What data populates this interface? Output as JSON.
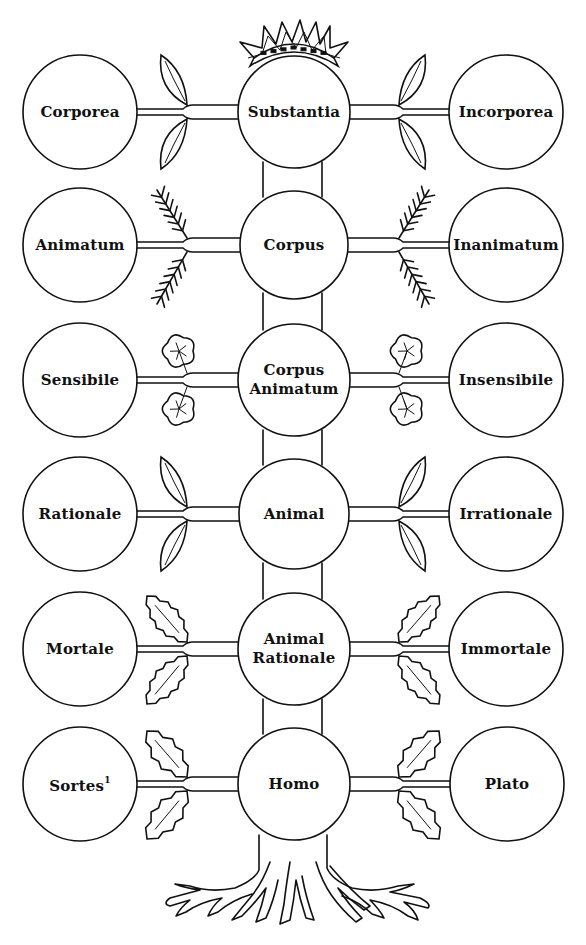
{
  "diagram": {
    "colors": {
      "ink": "#111111",
      "paper": "#ffffff"
    },
    "crown": {
      "icon": "crown-icon"
    },
    "roots": {
      "icon": "roots-icon"
    },
    "rows": [
      {
        "y": 112,
        "leaf_style": "oval-leaf",
        "left": {
          "label": "Corporea",
          "cx": 80,
          "r": 57
        },
        "center": {
          "label": "Substantia",
          "cx": 294,
          "r": 56
        },
        "right": {
          "label": "Incorporea",
          "cx": 506,
          "r": 57
        }
      },
      {
        "y": 245,
        "leaf_style": "fern-leaf",
        "left": {
          "label": "Animatum",
          "cx": 80,
          "r": 57
        },
        "center": {
          "label": "Corpus",
          "cx": 294,
          "r": 54
        },
        "right": {
          "label": "Inanimatum",
          "cx": 506,
          "r": 57
        }
      },
      {
        "y": 380,
        "leaf_style": "lobed-leaf",
        "left": {
          "label": "Sensibile",
          "cx": 80,
          "r": 57
        },
        "center": {
          "label": "Corpus Animatum",
          "line1": "Corpus",
          "line2": "Animatum",
          "cx": 294,
          "r": 56
        },
        "right": {
          "label": "Insensibile",
          "cx": 506,
          "r": 57
        }
      },
      {
        "y": 514,
        "leaf_style": "oval-leaf",
        "left": {
          "label": "Rationale",
          "cx": 80,
          "r": 57
        },
        "center": {
          "label": "Animal",
          "cx": 294,
          "r": 55
        },
        "right": {
          "label": "Irrationale",
          "cx": 506,
          "r": 57
        }
      },
      {
        "y": 649,
        "leaf_style": "holly-leaf",
        "left": {
          "label": "Mortale",
          "cx": 80,
          "r": 57
        },
        "center": {
          "label": "Animal Rationale",
          "line1": "Animal",
          "line2": "Rationale",
          "cx": 294,
          "r": 56
        },
        "right": {
          "label": "Immortale",
          "cx": 506,
          "r": 57
        }
      },
      {
        "y": 784,
        "leaf_style": "oak-leaf",
        "left": {
          "label": "Sortes",
          "footnote": "1",
          "cx": 80,
          "r": 57
        },
        "center": {
          "label": "Homo",
          "cx": 294,
          "r": 56
        },
        "right": {
          "label": "Plato",
          "cx": 507,
          "r": 57
        }
      }
    ]
  }
}
